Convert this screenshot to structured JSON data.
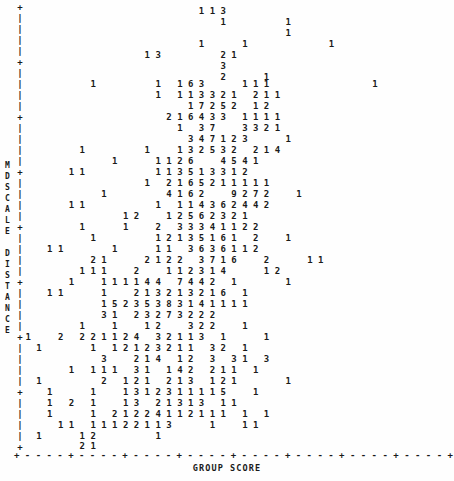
{
  "chart_data": {
    "type": "scatter",
    "title": "",
    "subtitle": "",
    "xlabel": "GROUP SCORE",
    "ylabel": "MDSCALE DISTANCE",
    "encoding": "character-cell count plot: each printed digit is the number of overlapping observations at that cell",
    "grid": false,
    "legend": null,
    "axis_style": {
      "x_axis_line": "+ - - - - + - - - - + - - - - + - - - - + - - - - + - - - - + - - - - + - - - - +",
      "y_axis_line": "alternating | with + at major ticks",
      "x_tick_count": 9,
      "y_tick_count": 9,
      "tick_labels_shown": false
    },
    "n_rows": 41,
    "n_cols": 46,
    "rows": [
      "                                 1 1 3",
      "                                     1           1",
      "                                                 1",
      "                                 1       1               1",
      "                       1 3           2 1",
      "                                     3",
      "                                     2       1",
      "             1           1   1 6 3       1 1 1                   1",
      "                         1   1 1 3 3 2 1   2 1 1",
      "                               1 7 2 5 2   1 2",
      "                           2 1 6 4 3 3   1 1 1 1",
      "                             1   3 7     3 3 2 1",
      "                               3 4 7 1 2 3       1",
      "           1           1     1 3 2 5 3 2   2 1 4",
      "                 1       1 1 2 6     4 5 4 1",
      "         1 1             1 1 3 5 1 3 3 1 2",
      "                       1   2 1 6 5 2 1 1 1 1 1",
      "               1           4 1 6 2     9 2 7 2     1",
      "         1 1             1   1 1 4 3 6 2 4 4 2",
      "                   1 2     1 2 5 6 2 3 2 1",
      "           1       1     2   3 3 3 4 1 1 2 2",
      "             1           1 2 1 3 5 1 6 1   2     1",
      "     1 1         1       1 1   3 6 3 6 1 1 2",
      "     2 1     2 1 2 2     3 7 1 6     2         1 1",
      "                   1       1 1   3 6 3 6 1 1 2",
      "             2 1       2 1 2 2   3 7 1 6     2       1 1",
      "           1 1 1     2     1 1 2 3 1 4       1 2",
      "         1     1 1 1 1 4 4   7 4 4 2   1         1",
      "     1 1       1     2 1 3 2 1 3 2 1 6   1",
      "               1 5 2 3 5 3 8 3 1 4 1 1 1 1",
      "               3 1   2 3 2 7 3 2 2 2",
      "           1     1     1 2     3 2 2     1",
      " 1     2   2 2 1 1 2 4   3 2 1 1 3   1       1",
      "       1       2   2 2 1 1 2 4   3 2 1 1 3   1       1",
      "   1         1   1 2 1 2 3 2 1 1   3 2   1",
      "               3     2 1 4   1 2   3   3 1   3",
      "         1   1 1 1   3 1   1 4 2   2 1 1   1",
      "   1           2   1 2 1   2 1 3   1 2 1         1",
      "     1       1     1 3 1 2 3 1 1 1 1 5     1",
      "     1   2   1     1 3   2 1 3 1 3   1 1",
      "     1       1   2 1 2 2 4 1 1 2 1 1 1   1   1"
    ]
  },
  "plot": {
    "x_axis_title": "GROUP SCORE",
    "y_axis_title_chars": "MDSCALE DISTANCE",
    "y_axis_label_lines": [
      "M",
      "D",
      "S",
      "C",
      "A",
      "L",
      "E",
      "",
      "D",
      "I",
      "S",
      "T",
      "A",
      "N",
      "C",
      "E"
    ],
    "x_axis_line": "+ - - - - + - - - - + - - - - + - - - - + - - - - + - - - - + - - - - + - - - - +",
    "rows": [
      {
        "y": 6,
        "text": "                                 1 1 3"
      },
      {
        "y": 17,
        "text": "                                     1           1"
      },
      {
        "y": 28,
        "text": "                                                 1"
      },
      {
        "y": 39,
        "text": "                                 1       1               1"
      },
      {
        "y": 50,
        "text": "                       1 3           2 1"
      },
      {
        "y": 61,
        "text": "                                     3"
      },
      {
        "y": 72,
        "text": "                                     2       1"
      },
      {
        "y": 79,
        "text": "             1           1   1 6 3       1 1 1                   1"
      },
      {
        "y": 90,
        "text": "                         1   1 1 3 3 2 1   2 1 1"
      },
      {
        "y": 101,
        "text": "                               1 7 2 5 2   1 2"
      },
      {
        "y": 112,
        "text": "                           2 1 6 4 3 3   1 1 1 1"
      },
      {
        "y": 123,
        "text": "                             1   3 7     3 3 2 1"
      },
      {
        "y": 134,
        "text": "                               3 4 7 1 2 3       1"
      },
      {
        "y": 145,
        "text": "           1           1     1 3 2 5 3 2   2 1 4"
      },
      {
        "y": 156,
        "text": "                 1       1 1 2 6     4 5 4 1"
      },
      {
        "y": 167,
        "text": "         1 1             1 1 3 5 1 3 3 1 2"
      },
      {
        "y": 178,
        "text": "                       1   2 1 6 5 2 1 1 1 1 1"
      },
      {
        "y": 189,
        "text": "               1           4 1 6 2     9 2 7 2     1"
      },
      {
        "y": 200,
        "text": "         1 1             1   1 1 4 3 6 2 4 4 2"
      },
      {
        "y": 211,
        "text": "                   1 2     1 2 5 6 2 3 2 1"
      },
      {
        "y": 222,
        "text": "           1       1     2   3 3 3 4 1 1 2 2"
      },
      {
        "y": 233,
        "text": "             1           1 2 1 3 5 1 6 1   2     1"
      },
      {
        "y": 244,
        "text": "     1 1         1       1 1   3 6 3 6 1 1 2"
      },
      {
        "y": 255,
        "text": "             2 1       2 1 2 2   3 7 1 6     2       1 1"
      },
      {
        "y": 266,
        "text": "           1 1 1     2     1 1 2 3 1 4       1 2"
      },
      {
        "y": 277,
        "text": "         1     1 1 1 1 4 4   7 4 4 2   1         1"
      },
      {
        "y": 288,
        "text": "     1 1       1     2 1 3 2 1 3 2 1 6   1"
      },
      {
        "y": 299,
        "text": "               1 5 2 3 5 3 8 3 1 4 1 1 1 1"
      },
      {
        "y": 310,
        "text": "               3 1   2 3 2 7 3 2 2 2"
      },
      {
        "y": 321,
        "text": "           1     1     1 2     3 2 2     1"
      },
      {
        "y": 332,
        "text": " 1     2   2 2 1 1 2 4   3 2 1 1 3   1       1"
      },
      {
        "y": 343,
        "text": "   1         1   1 2 1 2 3 2 1 1   3 2   1"
      },
      {
        "y": 354,
        "text": "               3     2 1 4   1 2   3   3 1   3"
      },
      {
        "y": 365,
        "text": "         1   1 1 1   3 1   1 4 2   2 1 1   1"
      },
      {
        "y": 376,
        "text": "   1           2   1 2 1   2 1 3   1 2 1         1"
      },
      {
        "y": 387,
        "text": "     1       1     1 3 1 2 3 1 1 1 1 5     1"
      },
      {
        "y": 398,
        "text": "     1   2   1     1 3   2 1 3 1 3   1 1"
      },
      {
        "y": 409,
        "text": "     1       1   2 1 2 2 4 1 1 2 1 1 1   1   1"
      },
      {
        "y": 420,
        "text": "       1 1   1 1 1 2 2 1 1 3       1     1 1"
      },
      {
        "y": 431,
        "text": "   1       1 2           1"
      },
      {
        "y": 441,
        "text": "           2 1"
      }
    ]
  }
}
